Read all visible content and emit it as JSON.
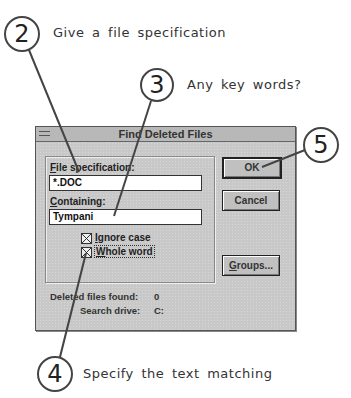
{
  "callouts": [
    {
      "number": "2",
      "text": "Give a file specification"
    },
    {
      "number": "3",
      "text": "Any key words?"
    },
    {
      "number": "4",
      "text": "Specify the text matching"
    },
    {
      "number": "5",
      "text": ""
    }
  ],
  "dialog": {
    "title": "Find Deleted Files",
    "file_spec_label": "File specification:",
    "file_spec_value": "*.DOC",
    "containing_label": "Containing:",
    "containing_value": "Tympani",
    "ignore_case_label": "Ignore case",
    "ignore_case_checked": true,
    "whole_word_label": "Whole word",
    "whole_word_checked": true,
    "ok_label": "OK",
    "cancel_label": "Cancel",
    "groups_label": "Groups...",
    "deleted_found_label": "Deleted files found:",
    "deleted_found_value": "0",
    "search_drive_label": "Search drive:",
    "search_drive_value": "C:"
  }
}
